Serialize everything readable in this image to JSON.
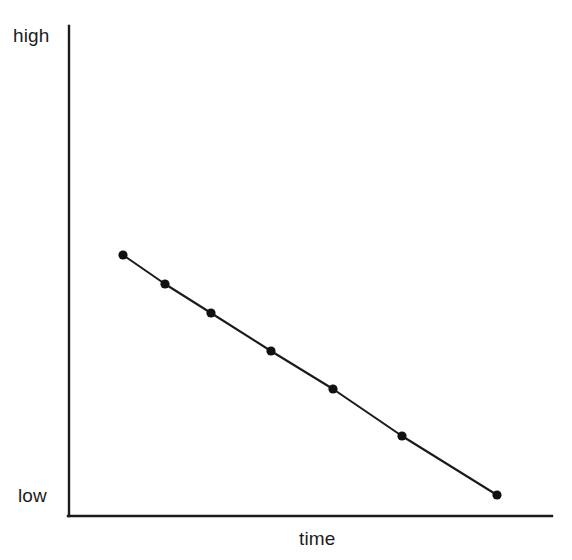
{
  "figure": {
    "background_color": "#ffffff",
    "ink_color": "#1b1b1b"
  },
  "labels": {
    "y_axis_high": "high",
    "y_axis_low": "low",
    "x_axis": "time"
  },
  "chart_data": {
    "type": "line",
    "title": "",
    "subtitle": "",
    "xlabel": "time",
    "ylabel": "",
    "ylim": [
      0,
      100
    ],
    "xlim": [
      0,
      100
    ],
    "grid": false,
    "legend": "none",
    "y_tick_labels": [
      "low",
      "high"
    ],
    "x_tick_labels": [],
    "annotations": [],
    "marker": "filled-circle",
    "marker_color": "#111111",
    "line_color": "#1b1b1b",
    "series": [
      {
        "name": "trend",
        "x": [
          11,
          20,
          29,
          41,
          54,
          68,
          87
        ],
        "values": [
          72,
          61,
          50,
          36,
          22,
          5,
          -17
        ]
      }
    ],
    "pixel_points": [
      {
        "x": 123,
        "y": 255
      },
      {
        "x": 165,
        "y": 284
      },
      {
        "x": 211,
        "y": 313
      },
      {
        "x": 271,
        "y": 351
      },
      {
        "x": 333,
        "y": 389
      },
      {
        "x": 402,
        "y": 436
      },
      {
        "x": 497,
        "y": 495
      }
    ],
    "axes_geometry": {
      "origin_x": 69,
      "origin_y": 516,
      "y_axis_top": 26,
      "x_axis_right": 552
    }
  }
}
